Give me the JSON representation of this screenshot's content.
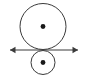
{
  "figure": {
    "background_color": "#ffffff",
    "stroke_color": "#3a3a3a",
    "dot_color": "#1a1a1a",
    "canvas": {
      "width": 87,
      "height": 78
    }
  },
  "chart_data": {
    "type": "scatter",
    "xlabel": "",
    "ylabel": "",
    "xlim": [
      0,
      87
    ],
    "ylim": [
      0,
      78
    ],
    "grid": false,
    "legend": null,
    "annotations": [],
    "shapes": [
      {
        "name": "large-circle",
        "type": "circle",
        "cx": 43,
        "cy": 26.5,
        "r": 23,
        "fill": "none",
        "stroke": "#3a3a3a",
        "stroke_width": 1
      },
      {
        "name": "small-circle",
        "type": "circle",
        "cx": 43,
        "cy": 62.5,
        "r": 12,
        "fill": "none",
        "stroke": "#3a3a3a",
        "stroke_width": 1
      },
      {
        "name": "horizontal-axis",
        "type": "line",
        "x1": 10,
        "y1": 50,
        "x2": 78,
        "y2": 50,
        "stroke": "#3a3a3a",
        "stroke_width": 1.1,
        "arrowheads": "both"
      },
      {
        "name": "large-circle-center-dot",
        "type": "point",
        "cx": 43,
        "cy": 26.5,
        "r": 2.4,
        "fill": "#1a1a1a"
      },
      {
        "name": "small-circle-center-dot",
        "type": "point",
        "cx": 43,
        "cy": 62.5,
        "r": 2.4,
        "fill": "#1a1a1a"
      }
    ]
  }
}
